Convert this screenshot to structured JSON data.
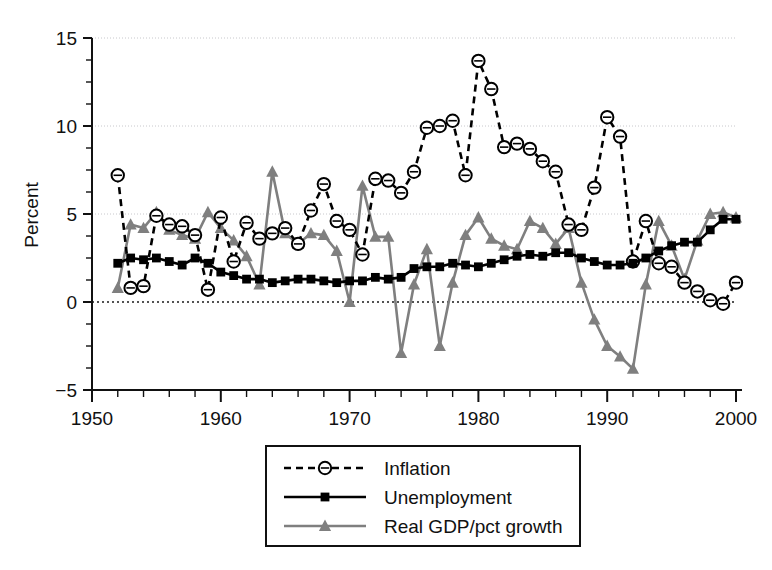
{
  "chart_data": {
    "type": "line",
    "title": "",
    "subtitle": "",
    "xlabel": "",
    "ylabel": "Percent",
    "xlim": [
      1950,
      2000
    ],
    "ylim": [
      -5,
      15
    ],
    "x_ticks": [
      1950,
      1960,
      1970,
      1980,
      1990,
      2000
    ],
    "x_tick_labels": [
      "1950",
      "1960",
      "1970",
      "1980",
      "1990",
      "2000"
    ],
    "x_minor_tick_step": 2,
    "y_ticks": [
      -5,
      0,
      5,
      10,
      15
    ],
    "y_tick_labels": [
      "−5",
      "0",
      "5",
      "10",
      "15"
    ],
    "y_minor_tick_step": 1.25,
    "grid": "horizontal-major-light",
    "zero_line": "dotted",
    "legend_position": "below-center",
    "x": [
      1952,
      1953,
      1954,
      1955,
      1956,
      1957,
      1958,
      1959,
      1960,
      1961,
      1962,
      1963,
      1964,
      1965,
      1966,
      1967,
      1968,
      1969,
      1970,
      1971,
      1972,
      1973,
      1974,
      1975,
      1976,
      1977,
      1978,
      1979,
      1980,
      1981,
      1982,
      1983,
      1984,
      1985,
      1986,
      1987,
      1988,
      1989,
      1990,
      1991,
      1992,
      1993,
      1994,
      1995,
      1996,
      1997,
      1998,
      1999,
      2000
    ],
    "series": [
      {
        "name": "Inflation",
        "color": "#000000",
        "line_style": "dashed",
        "marker": "open-circle",
        "values": [
          7.2,
          0.8,
          0.9,
          4.9,
          4.4,
          4.3,
          3.8,
          0.7,
          4.8,
          2.3,
          4.5,
          3.6,
          3.9,
          4.2,
          3.3,
          5.2,
          6.7,
          4.6,
          4.1,
          2.7,
          7.0,
          6.9,
          6.2,
          7.4,
          9.9,
          10.0,
          10.3,
          7.2,
          13.7,
          12.1,
          8.8,
          9.0,
          8.7,
          8.0,
          7.4,
          4.4,
          4.1,
          6.5,
          10.5,
          9.4,
          2.3,
          4.6,
          2.2,
          2.0,
          1.1,
          0.6,
          0.1,
          -0.1,
          1.1
        ]
      },
      {
        "name": "Unemployment",
        "color": "#000000",
        "line_style": "solid",
        "marker": "filled-square",
        "values": [
          2.2,
          2.5,
          2.4,
          2.5,
          2.3,
          2.1,
          2.5,
          2.2,
          1.7,
          1.5,
          1.3,
          1.3,
          1.1,
          1.2,
          1.3,
          1.3,
          1.2,
          1.1,
          1.2,
          1.2,
          1.4,
          1.3,
          1.4,
          1.9,
          2.0,
          2.0,
          2.2,
          2.1,
          2.0,
          2.2,
          2.4,
          2.6,
          2.7,
          2.6,
          2.8,
          2.8,
          2.5,
          2.3,
          2.1,
          2.1,
          2.2,
          2.5,
          2.9,
          3.2,
          3.4,
          3.4,
          4.1,
          4.7,
          4.7
        ]
      },
      {
        "name": "Real GDP/pct growth",
        "color": "#7f7f7f",
        "line_style": "solid",
        "marker": "filled-triangle",
        "values": [
          0.8,
          4.4,
          4.2,
          5.1,
          4.1,
          3.8,
          3.6,
          5.1,
          4.2,
          3.5,
          2.6,
          1.0,
          7.4,
          3.9,
          3.3,
          3.9,
          3.8,
          2.9,
          0.0,
          6.6,
          3.7,
          3.7,
          -2.9,
          1.0,
          3.0,
          -2.5,
          1.1,
          3.8,
          4.8,
          3.6,
          3.2,
          3.0,
          4.6,
          4.2,
          3.3,
          4.2,
          1.1,
          -1.0,
          -2.5,
          -3.1,
          -3.8,
          1.0,
          4.6,
          3.2,
          1.3,
          3.5,
          5.0,
          5.1,
          4.8
        ]
      }
    ]
  },
  "legend": {
    "items": [
      {
        "label": "Inflation"
      },
      {
        "label": "Unemployment"
      },
      {
        "label": "Real GDP/pct growth"
      }
    ]
  },
  "axes": {
    "y_title": "Percent"
  }
}
